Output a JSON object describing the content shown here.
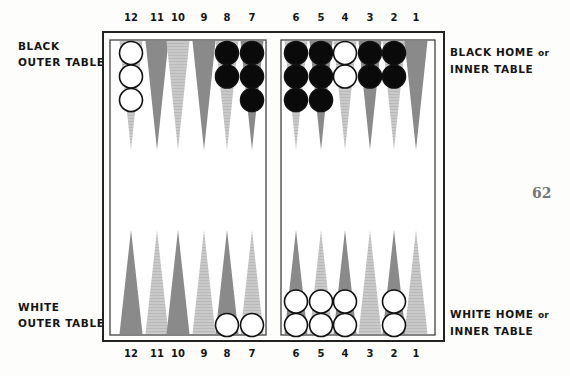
{
  "labels": {
    "black_outer": [
      "BLACK",
      "OUTER TABLE"
    ],
    "black_home": [
      "BLACK HOME",
      "or",
      "INNER TABLE"
    ],
    "white_outer": [
      "WHITE",
      "OUTER TABLE"
    ],
    "white_home": [
      "WHITE HOME",
      "or",
      "INNER TABLE"
    ]
  },
  "page_number": "62",
  "point_numbers_top": [
    "12",
    "11",
    "10",
    "9",
    "8",
    "7",
    "6",
    "5",
    "4",
    "3",
    "2",
    "1"
  ],
  "point_numbers_bottom": [
    "12",
    "11",
    "10",
    "9",
    "8",
    "7",
    "6",
    "5",
    "4",
    "3",
    "2",
    "1"
  ],
  "colors": {
    "dark_point": "#8a8a8a",
    "light_point": "#c4c4c4",
    "black_checker": "#0a0a0a",
    "white_checker": "#ffffff",
    "frame": "#222222"
  },
  "board": {
    "top_points": [
      {
        "point": "12",
        "shade": "light",
        "checkers": {
          "color": "white",
          "count": 3
        }
      },
      {
        "point": "11",
        "shade": "dark",
        "checkers": null
      },
      {
        "point": "10",
        "shade": "light",
        "checkers": null
      },
      {
        "point": "9",
        "shade": "dark",
        "checkers": null
      },
      {
        "point": "8",
        "shade": "light",
        "checkers": {
          "color": "black",
          "count": 2
        }
      },
      {
        "point": "7",
        "shade": "dark",
        "checkers": {
          "color": "black",
          "count": 3
        }
      },
      {
        "point": "6",
        "shade": "light",
        "checkers": {
          "color": "black",
          "count": 3
        }
      },
      {
        "point": "5",
        "shade": "dark",
        "checkers": {
          "color": "black",
          "count": 3
        }
      },
      {
        "point": "4",
        "shade": "light",
        "checkers": {
          "color": "white",
          "count": 2
        }
      },
      {
        "point": "3",
        "shade": "dark",
        "checkers": {
          "color": "black",
          "count": 2
        }
      },
      {
        "point": "2",
        "shade": "light",
        "checkers": {
          "color": "black",
          "count": 2
        }
      },
      {
        "point": "1",
        "shade": "dark",
        "checkers": null
      }
    ],
    "bottom_points": [
      {
        "point": "12",
        "shade": "dark",
        "checkers": null
      },
      {
        "point": "11",
        "shade": "light",
        "checkers": null
      },
      {
        "point": "10",
        "shade": "dark",
        "checkers": null
      },
      {
        "point": "9",
        "shade": "light",
        "checkers": null
      },
      {
        "point": "8",
        "shade": "dark",
        "checkers": {
          "color": "white",
          "count": 1
        }
      },
      {
        "point": "7",
        "shade": "light",
        "checkers": {
          "color": "white",
          "count": 1
        }
      },
      {
        "point": "6",
        "shade": "dark",
        "checkers": {
          "color": "white",
          "count": 2
        }
      },
      {
        "point": "5",
        "shade": "light",
        "checkers": {
          "color": "white",
          "count": 2
        }
      },
      {
        "point": "4",
        "shade": "dark",
        "checkers": {
          "color": "white",
          "count": 2
        }
      },
      {
        "point": "3",
        "shade": "light",
        "checkers": null
      },
      {
        "point": "2",
        "shade": "dark",
        "checkers": {
          "color": "white",
          "count": 2
        }
      },
      {
        "point": "1",
        "shade": "light",
        "checkers": null
      }
    ]
  }
}
